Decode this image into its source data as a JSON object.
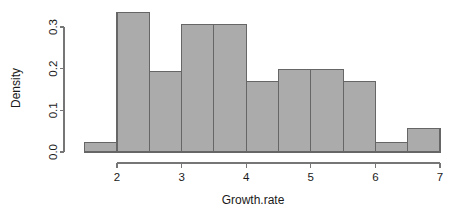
{
  "chart_data": {
    "type": "bar",
    "subtype": "histogram",
    "title": "",
    "subtitle": "",
    "xlabel": "Growth.rate",
    "ylabel": "Density",
    "xlim": [
      1.5,
      7.0
    ],
    "ylim": [
      0.0,
      0.335
    ],
    "grid": false,
    "legend": null,
    "bin_width": 0.5,
    "bin_edges": [
      1.5,
      2.0,
      2.5,
      3.0,
      3.5,
      4.0,
      4.5,
      5.0,
      5.5,
      6.0,
      6.5,
      7.0
    ],
    "bin_centers": [
      1.75,
      2.25,
      2.75,
      3.25,
      3.75,
      4.25,
      4.75,
      5.25,
      5.75,
      6.25,
      6.75
    ],
    "categories": [
      "1.5-2.0",
      "2.0-2.5",
      "2.5-3.0",
      "3.0-3.5",
      "3.5-4.0",
      "4.0-4.5",
      "4.5-5.0",
      "5.0-5.5",
      "5.5-6.0",
      "6.0-6.5",
      "6.5-7.0"
    ],
    "values": [
      0.023,
      0.335,
      0.193,
      0.305,
      0.305,
      0.17,
      0.198,
      0.198,
      0.17,
      0.023,
      0.057
    ],
    "xticks": [
      2,
      3,
      4,
      5,
      6,
      7
    ],
    "xtick_labels": [
      "2",
      "3",
      "4",
      "5",
      "6",
      "7"
    ],
    "yticks": [
      0.0,
      0.1,
      0.2,
      0.3
    ],
    "ytick_labels": [
      "0.0",
      "0.1",
      "0.2",
      "0.3"
    ],
    "bar_fill_color": "#ababab",
    "bar_border_color": "#666666",
    "axis_color": "#767676",
    "text_color": "#1a1a1a",
    "background_color": "#ffffff"
  },
  "axes": {
    "y_axis_title": "Density",
    "x_axis_title": "Growth.rate"
  }
}
